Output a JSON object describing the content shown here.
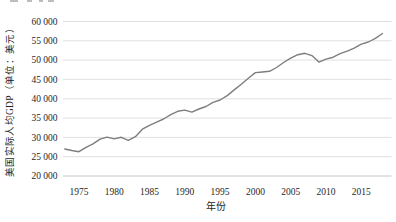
{
  "chart_data": {
    "type": "line",
    "title": "",
    "xlabel": "年份",
    "ylabel": "美国实际人均GDP（单位：美元）",
    "x": [
      1973,
      1974,
      1975,
      1976,
      1977,
      1978,
      1979,
      1980,
      1981,
      1982,
      1983,
      1984,
      1985,
      1986,
      1987,
      1988,
      1989,
      1990,
      1991,
      1992,
      1993,
      1994,
      1995,
      1996,
      1997,
      1998,
      1999,
      2000,
      2001,
      2002,
      2003,
      2004,
      2005,
      2006,
      2007,
      2008,
      2009,
      2010,
      2011,
      2012,
      2013,
      2014,
      2015,
      2016,
      2017,
      2018
    ],
    "values": [
      26996,
      26602,
      26293,
      27425,
      28302,
      29560,
      30069,
      29606,
      30014,
      29211,
      30164,
      32107,
      33118,
      33925,
      34756,
      35869,
      36738,
      37063,
      36543,
      37357,
      38000,
      39080,
      39685,
      40809,
      42291,
      43759,
      45323,
      46771,
      46914,
      47104,
      48090,
      49389,
      50490,
      51398,
      51776,
      51160,
      49478,
      50261,
      50746,
      51671,
      52300,
      53107,
      54128,
      54683,
      55617,
      56897
    ],
    "ylim": [
      20000,
      60000
    ],
    "yticks": [
      20000,
      25000,
      30000,
      35000,
      40000,
      45000,
      50000,
      55000,
      60000
    ],
    "ytick_labels": [
      "20 000",
      "25 000",
      "30 000",
      "35 000",
      "40 000",
      "45 000",
      "50 000",
      "55 000",
      "60 000"
    ],
    "xticks": [
      1975,
      1980,
      1985,
      1990,
      1995,
      2000,
      2005,
      2010,
      2015
    ],
    "xtick_labels": [
      "1975",
      "1980",
      "1985",
      "1990",
      "1995",
      "2000",
      "2005",
      "2010",
      "2015"
    ],
    "grid": "horizontal-light",
    "legend": "none",
    "background": "#ffffff",
    "line_color": "#7e7e7e",
    "grid_color": "#dcdcdc",
    "axis_color": "#c6c6c6",
    "text_color": "#1f1f1f"
  }
}
